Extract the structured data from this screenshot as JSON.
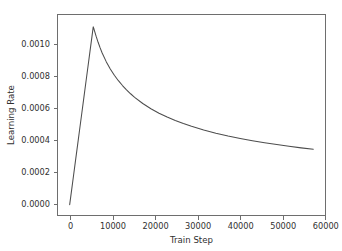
{
  "chart_data": {
    "type": "line",
    "title": "",
    "xlabel": "Train Step",
    "ylabel": "Learning Rate",
    "xlim": [
      -3000,
      63000
    ],
    "ylim": [
      -7e-05,
      0.00123
    ],
    "xticks": [
      0,
      10000,
      20000,
      30000,
      40000,
      50000,
      60000
    ],
    "xticklabels": [
      "0",
      "10000",
      "20000",
      "30000",
      "40000",
      "50000",
      "60000"
    ],
    "yticks": [
      0.0,
      0.0002,
      0.0004,
      0.0006,
      0.0008,
      0.001
    ],
    "yticklabels": [
      "0.0000",
      "0.0002",
      "0.0004",
      "0.0006",
      "0.0008",
      "0.0010"
    ],
    "grid": false,
    "legend": null,
    "line_color": "#4d4d4d",
    "series": [
      {
        "name": "learning rate schedule",
        "x": [
          0,
          500,
          1000,
          1500,
          2000,
          2500,
          3000,
          3500,
          4000,
          4500,
          5000,
          5500,
          5800,
          6000,
          6500,
          7000,
          7500,
          8000,
          9000,
          10000,
          11000,
          12000,
          13000,
          14000,
          15000,
          16000,
          18000,
          20000,
          22000,
          24000,
          26000,
          28000,
          30000,
          33000,
          36000,
          39000,
          42000,
          45000,
          48000,
          51000,
          54000,
          57000,
          60000
        ],
        "y": [
          0.0,
          9.91e-05,
          0.0001983,
          0.0002974,
          0.0003966,
          0.0004957,
          0.0005948,
          0.000694,
          0.0007931,
          0.0008922,
          0.0009914,
          0.0010905,
          0.00115,
          0.0011344,
          0.0010901,
          0.0010502,
          0.001014,
          0.0009814,
          0.0009251,
          0.0008778,
          0.0008372,
          0.0008018,
          0.0007706,
          0.0007426,
          0.0007174,
          0.0006945,
          0.0006544,
          0.0006206,
          0.0005918,
          0.0005665,
          0.0005443,
          0.0005245,
          0.0005067,
          0.000483,
          0.0004624,
          0.0004444,
          0.0004283,
          0.0004137,
          0.0004006,
          0.0003886,
          0.0003776,
          0.0003675,
          0.0003581
        ]
      }
    ],
    "annotations": {
      "peak_step": 6000,
      "peak_value": 0.00115,
      "final_step": 60000,
      "final_value": 0.000358,
      "warmup_description": "linear warmup then inverse-sqrt decay"
    }
  }
}
